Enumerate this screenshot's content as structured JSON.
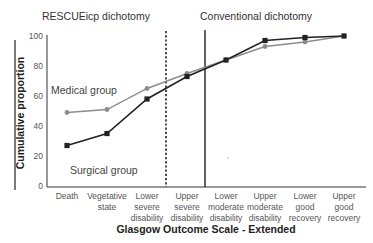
{
  "chart_data": {
    "type": "line",
    "title": "",
    "xlabel": "Glasgow Outcome Scale - Extended",
    "ylabel": "Cumulative proportion",
    "ylim": [
      0,
      100
    ],
    "yticks": [
      0,
      20,
      40,
      60,
      80,
      100
    ],
    "grid": false,
    "categories": [
      [
        "Death"
      ],
      [
        "Vegetative",
        "state"
      ],
      [
        "Lower",
        "severe",
        "disability"
      ],
      [
        "Upper",
        "severe",
        "disability"
      ],
      [
        "Lower",
        "moderate",
        "disability"
      ],
      [
        "Upper",
        "moderate",
        "disability"
      ],
      [
        "Lower",
        "good",
        "recovery"
      ],
      [
        "Upper",
        "good",
        "recovery"
      ]
    ],
    "series": [
      {
        "name": "Medical group",
        "color": "#8c8c8c",
        "marker": "circle",
        "values": [
          49,
          51,
          65,
          75,
          84,
          93,
          96,
          100
        ]
      },
      {
        "name": "Surgical group",
        "color": "#222222",
        "marker": "square",
        "values": [
          27,
          35,
          58,
          73,
          84,
          97,
          99,
          100
        ]
      }
    ],
    "annotations": {
      "region_left": "RESCUEicp dichotomy",
      "region_right": "Conventional dichotomy",
      "dashed_divider_between": [
        "Lower severe disability",
        "Upper severe disability"
      ],
      "solid_divider_between": [
        "Upper severe disability",
        "Lower moderate disability"
      ]
    },
    "legend_position": "inline labels"
  }
}
